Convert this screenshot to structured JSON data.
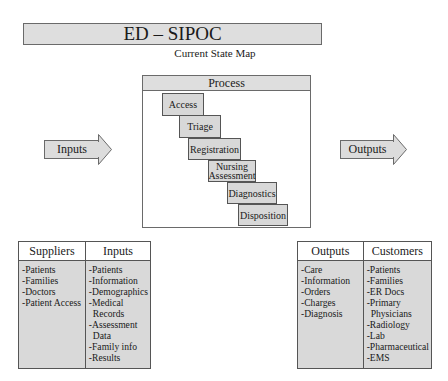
{
  "header": {
    "title": "ED – SIPOC",
    "subtitle": "Current State Map"
  },
  "process": {
    "title": "Process",
    "steps": [
      {
        "label": "Access"
      },
      {
        "label": "Triage"
      },
      {
        "label": "Registration"
      },
      {
        "label_line1": "Nursing",
        "label_line2": "Assessment"
      },
      {
        "label": "Diagnostics"
      },
      {
        "label": "Disposition"
      }
    ]
  },
  "arrows": {
    "inputs_label": "Inputs",
    "outputs_label": "Outputs"
  },
  "left_table": {
    "suppliers": {
      "header": "Suppliers",
      "items": [
        "-Patients",
        "-Families",
        "-Doctors",
        "-Patient Access"
      ]
    },
    "inputs": {
      "header": "Inputs",
      "items": [
        "-Patients",
        "-Information",
        "-Demographics",
        "-Medical",
        "Records",
        "-Assessment",
        "Data",
        "-Family info",
        "-Results"
      ]
    }
  },
  "right_table": {
    "outputs": {
      "header": "Outputs",
      "items": [
        "-Care",
        "-Information",
        "-Orders",
        "-Charges",
        "-Diagnosis"
      ]
    },
    "customers": {
      "header": "Customers",
      "items": [
        "-Patients",
        "-Families",
        "-ER Docs",
        "-Primary",
        "Physicians",
        "-Radiology",
        "-Lab",
        "-Pharmaceutical",
        "-EMS"
      ]
    }
  },
  "colors": {
    "fill_gray": "#dcdcdc",
    "border": "#6a6a6a",
    "background": "#ffffff"
  }
}
